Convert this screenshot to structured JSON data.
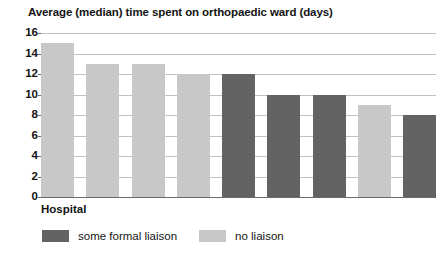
{
  "chart_data": {
    "type": "bar",
    "title": "Average (median) time spent on orthopaedic ward (days)",
    "xlabel": "Hospital",
    "ylabel": "",
    "ylim": [
      0,
      16
    ],
    "ytick_labels": [
      "16",
      "14",
      "12",
      "10",
      "8",
      "6",
      "4",
      "2",
      "0"
    ],
    "ytick_values": [
      16,
      14,
      12,
      10,
      8,
      6,
      4,
      2,
      0
    ],
    "grid": true,
    "legend_position": "bottom-left",
    "categories": [
      "1",
      "2",
      "3",
      "4",
      "5",
      "6",
      "7",
      "8",
      "9"
    ],
    "values": [
      15,
      13,
      13,
      12,
      12,
      10,
      10,
      9,
      8
    ],
    "bar_groups": [
      "no liaison",
      "no liaison",
      "no liaison",
      "no liaison",
      "some formal liaison",
      "some formal liaison",
      "some formal liaison",
      "no liaison",
      "some formal liaison"
    ],
    "series": [
      {
        "name": "no liaison",
        "color": "#c8c8c8",
        "points": [
          {
            "index": 0,
            "value": 15
          },
          {
            "index": 1,
            "value": 13
          },
          {
            "index": 2,
            "value": 13
          },
          {
            "index": 3,
            "value": 12
          },
          {
            "index": 7,
            "value": 9
          }
        ]
      },
      {
        "name": "some formal liaison",
        "color": "#636363",
        "points": [
          {
            "index": 4,
            "value": 12
          },
          {
            "index": 5,
            "value": 10
          },
          {
            "index": 6,
            "value": 10
          },
          {
            "index": 8,
            "value": 8
          }
        ]
      }
    ],
    "legend": [
      {
        "label": "some formal liaison",
        "color": "#636363"
      },
      {
        "label": "no liaison",
        "color": "#c8c8c8"
      }
    ]
  },
  "colors": {
    "dark_bar": "#636363",
    "light_bar": "#c8c8c8",
    "gridline": "#c2c2c2",
    "axis": "#6b6b6b",
    "text": "#141414",
    "background": "#ffffff"
  }
}
